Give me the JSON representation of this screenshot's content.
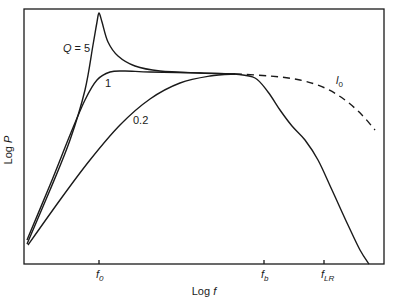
{
  "chart_data": {
    "type": "line",
    "title": "",
    "xlabel": "Log f",
    "ylabel": "Log P",
    "xlabel_parts": {
      "prefix": "Log ",
      "var": "f"
    },
    "ylabel_parts": {
      "prefix": "Log ",
      "var": "P"
    },
    "grid": false,
    "x_ticks": [
      {
        "label": "f",
        "sub": "0",
        "x": 99
      },
      {
        "label": "f",
        "sub": "b",
        "x": 264
      },
      {
        "label": "f",
        "sub": "LR",
        "x": 324
      }
    ],
    "series": [
      {
        "name": "Q = 5",
        "style": "solid",
        "label": "Q = 5",
        "label_pos": [
          63,
          52
        ],
        "points": [
          [
            27,
            244
          ],
          [
            50,
            190
          ],
          [
            70,
            140
          ],
          [
            85,
            90
          ],
          [
            93,
            45
          ],
          [
            97,
            22
          ],
          [
            99,
            13
          ],
          [
            102,
            22
          ],
          [
            108,
            42
          ],
          [
            118,
            56
          ],
          [
            135,
            66
          ],
          [
            160,
            71
          ],
          [
            200,
            73
          ],
          [
            235,
            74
          ]
        ]
      },
      {
        "name": "Q = 1",
        "style": "solid",
        "label": "1",
        "label_pos": [
          105,
          87
        ],
        "points": [
          [
            27,
            240
          ],
          [
            50,
            185
          ],
          [
            70,
            135
          ],
          [
            85,
            100
          ],
          [
            97,
            80
          ],
          [
            110,
            72
          ],
          [
            125,
            71
          ],
          [
            150,
            72
          ],
          [
            200,
            73
          ],
          [
            235,
            74
          ]
        ]
      },
      {
        "name": "Q = 0.2",
        "style": "solid",
        "label": "0.2",
        "label_pos": [
          133,
          124
        ],
        "points": [
          [
            28,
            245
          ],
          [
            60,
            200
          ],
          [
            90,
            160
          ],
          [
            120,
            125
          ],
          [
            150,
            99
          ],
          [
            180,
            83
          ],
          [
            210,
            76
          ],
          [
            235,
            74
          ]
        ]
      },
      {
        "name": "f_b cutoff",
        "style": "solid",
        "points": [
          [
            235,
            74
          ],
          [
            255,
            78
          ],
          [
            268,
            92
          ],
          [
            280,
            110
          ],
          [
            292,
            126
          ],
          [
            305,
            140
          ],
          [
            318,
            160
          ],
          [
            332,
            190
          ],
          [
            348,
            225
          ],
          [
            360,
            250
          ],
          [
            369,
            264
          ]
        ]
      },
      {
        "name": "l_0",
        "style": "dashed",
        "label": "l",
        "label_sub": "0",
        "label_pos": [
          336,
          84
        ],
        "points": [
          [
            235,
            74
          ],
          [
            270,
            76
          ],
          [
            300,
            80
          ],
          [
            325,
            88
          ],
          [
            345,
            100
          ],
          [
            362,
            115
          ],
          [
            375,
            130
          ]
        ]
      }
    ],
    "plot_frame": {
      "x0": 24,
      "y0": 9,
      "x1": 384,
      "y1": 264
    },
    "color": "#1a1a1a"
  }
}
